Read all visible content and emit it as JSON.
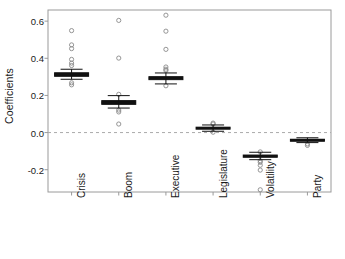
{
  "chart_data": {
    "type": "box",
    "title": "",
    "subtitle": "",
    "xlabel": "",
    "ylabel": "Coefficients",
    "categories": [
      "Crisis",
      "Boom",
      "Executive",
      "Legislature",
      "Volatility",
      "Party"
    ],
    "ylim": [
      -0.32,
      0.66
    ],
    "yticks": [
      0.6,
      0.4,
      0.2,
      0.0,
      -0.2
    ],
    "ytick_labels": [
      "0.6",
      "0.4",
      "0.2",
      "0.0",
      "-0.2"
    ],
    "grid": false,
    "legend": "none",
    "reference_line": {
      "y": 0.0,
      "style": "dashed",
      "color": "#aaaaaa"
    },
    "box_color": "#111111",
    "outlier_color": "#8a8a8a",
    "frame_color": "#9a9a9a",
    "boxes": [
      {
        "name": "Crisis",
        "median": 0.313,
        "q1": 0.303,
        "q3": 0.322,
        "whisker_low": 0.287,
        "whisker_high": 0.341,
        "outliers": [
          0.549,
          0.472,
          0.452,
          0.394,
          0.374,
          0.361,
          0.268,
          0.257
        ]
      },
      {
        "name": "Boom",
        "median": 0.161,
        "q1": 0.152,
        "q3": 0.172,
        "whisker_low": 0.132,
        "whisker_high": 0.199,
        "outliers": [
          0.604,
          0.401,
          0.206,
          0.121,
          0.111,
          0.046
        ]
      },
      {
        "name": "Executive",
        "median": 0.293,
        "q1": 0.285,
        "q3": 0.301,
        "whisker_low": 0.262,
        "whisker_high": 0.321,
        "outliers": [
          0.632,
          0.546,
          0.448,
          0.353,
          0.341,
          0.334,
          0.252
        ]
      },
      {
        "name": "Legislature",
        "median": 0.024,
        "q1": 0.019,
        "q3": 0.029,
        "whisker_low": 0.007,
        "whisker_high": 0.041,
        "outliers": [
          0.051,
          0.046,
          0.002
        ]
      },
      {
        "name": "Volatility",
        "median": -0.127,
        "q1": -0.133,
        "q3": -0.121,
        "whisker_low": -0.146,
        "whisker_high": -0.106,
        "outliers": [
          -0.104,
          -0.152,
          -0.16,
          -0.176,
          -0.202,
          -0.308
        ]
      },
      {
        "name": "Party",
        "median": -0.04,
        "q1": -0.045,
        "q3": -0.036,
        "whisker_low": -0.054,
        "whisker_high": -0.028,
        "outliers": [
          -0.061,
          -0.069
        ]
      }
    ]
  }
}
